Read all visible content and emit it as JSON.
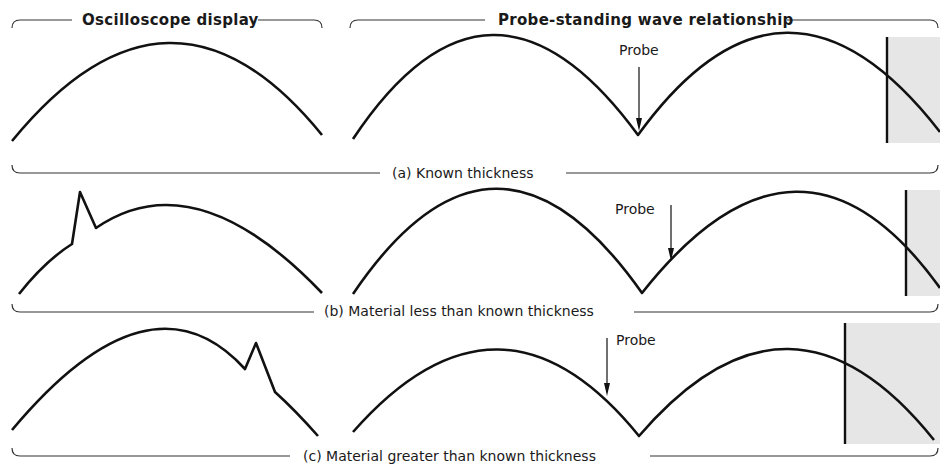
{
  "headers": {
    "left": "Oscilloscope display",
    "right": "Probe-standing wave relationship"
  },
  "panels": [
    {
      "id": "a",
      "caption": "(a) Known thickness",
      "probe_label": "Probe",
      "probe_position": "at node (minimum)",
      "spike": "none"
    },
    {
      "id": "b",
      "caption": "(b) Material less than known thickness",
      "probe_label": "Probe",
      "probe_position": "right of node, on rising slope",
      "spike": "left side of trace"
    },
    {
      "id": "c",
      "caption": "(c) Material greater than known thickness",
      "probe_label": "Probe",
      "probe_position": "left of node, on falling slope",
      "spike": "right side of trace"
    }
  ],
  "colors": {
    "line": "#111111",
    "material_shade": "#e6e6e6",
    "background": "#ffffff"
  }
}
